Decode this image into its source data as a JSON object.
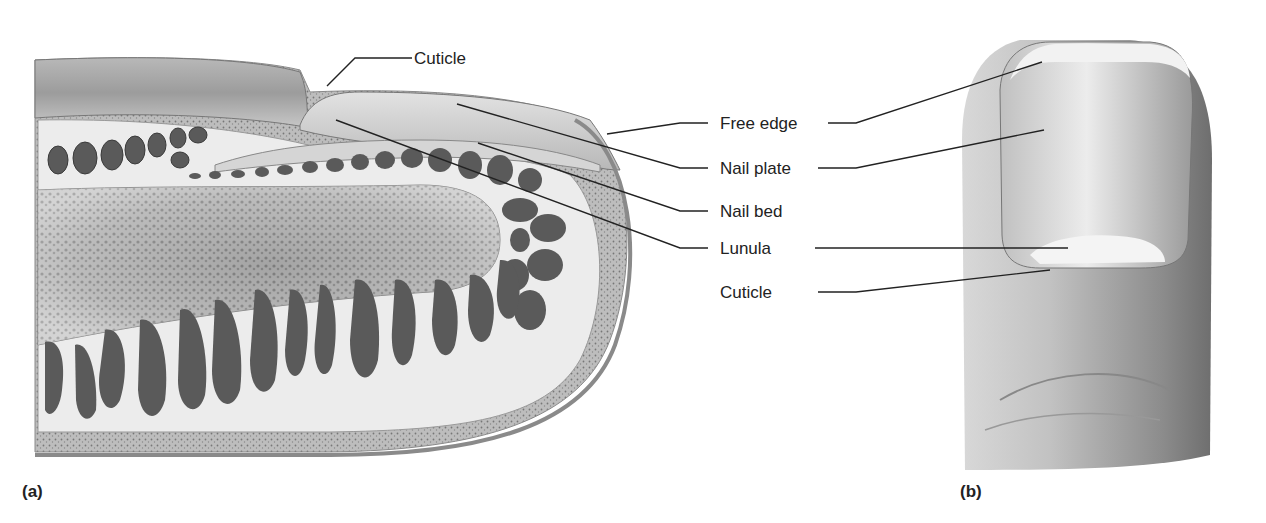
{
  "figure": {
    "panels": [
      {
        "id": "a",
        "label": "(a)",
        "view": "sagittal section of fingertip"
      },
      {
        "id": "b",
        "label": "(b)",
        "view": "dorsal view of fingertip"
      }
    ]
  },
  "labels": {
    "cuticle_top": "Cuticle",
    "free_edge": "Free edge",
    "nail_plate": "Nail plate",
    "nail_bed": "Nail bed",
    "lunula": "Lunula",
    "cuticle_right": "Cuticle"
  },
  "colors": {
    "leader_line": "#222222",
    "tissue_dark": "#5a5a5a",
    "tissue_light": "#e6e6e6",
    "skin": "#c9c9c9"
  }
}
